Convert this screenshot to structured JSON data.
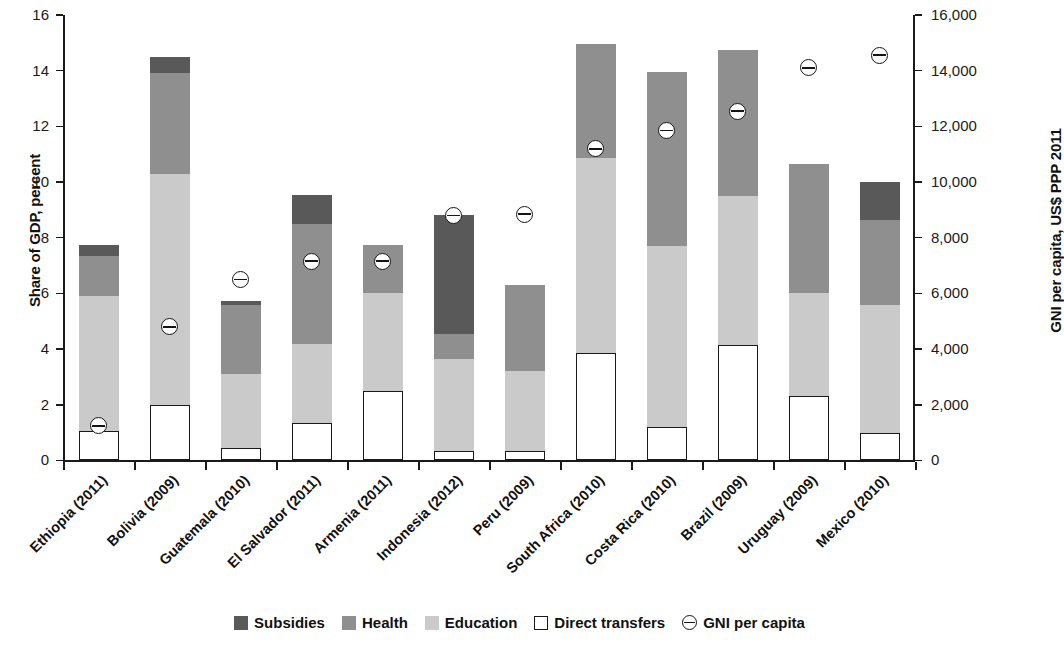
{
  "chart_data": {
    "type": "bar",
    "stacked": true,
    "title": "",
    "xlabel": "",
    "ylabel": "Share of GDP, percent",
    "y2label": "GNI per capita, US$ PPP 2011",
    "ylim": [
      0,
      16
    ],
    "y2lim": [
      0,
      16000
    ],
    "yticks": [
      "0",
      "2",
      "4",
      "6",
      "8",
      "10",
      "12",
      "14",
      "16"
    ],
    "ytick_values": [
      0,
      2,
      4,
      6,
      8,
      10,
      12,
      14,
      16
    ],
    "y2ticks": [
      "0",
      "2,000",
      "4,000",
      "6,000",
      "8,000",
      "10,000",
      "12,000",
      "14,000",
      "16,000"
    ],
    "y2tick_values": [
      0,
      2000,
      4000,
      6000,
      8000,
      10000,
      12000,
      14000,
      16000
    ],
    "grid": false,
    "legend_position": "bottom",
    "categories": [
      "Ethiopia (2011)",
      "Bolivia (2009)",
      "Guatemala (2010)",
      "El Salvador (2011)",
      "Armenia (2011)",
      "Indonesia (2012)",
      "Peru (2009)",
      "South Africa (2010)",
      "Costa Rica (2010)",
      "Brazil (2009)",
      "Uruguay (2009)",
      "Mexico (2010)"
    ],
    "series": [
      {
        "name": "Direct transfers",
        "color": "#ffffff",
        "values": [
          1.05,
          2.0,
          0.45,
          1.35,
          2.5,
          0.35,
          0.35,
          3.85,
          1.2,
          4.15,
          2.3,
          1.0
        ]
      },
      {
        "name": "Education",
        "color": "#cacaca",
        "values": [
          4.85,
          8.3,
          2.65,
          2.85,
          3.5,
          3.3,
          2.85,
          7.0,
          6.5,
          5.35,
          3.7,
          4.6
        ]
      },
      {
        "name": "Health",
        "color": "#8f8f8f",
        "values": [
          1.45,
          3.6,
          2.5,
          4.3,
          1.75,
          0.9,
          3.1,
          4.1,
          6.25,
          5.25,
          4.65,
          3.05
        ]
      },
      {
        "name": "Subsidies",
        "color": "#595959",
        "values": [
          0.4,
          0.6,
          0.12,
          1.05,
          0.0,
          4.25,
          0.0,
          0.0,
          0.0,
          0.0,
          0.0,
          1.35
        ]
      }
    ],
    "totals": [
      7.75,
      14.5,
      5.72,
      9.55,
      7.75,
      8.8,
      6.3,
      14.95,
      13.95,
      14.75,
      10.65,
      10.0
    ],
    "gni_series": {
      "name": "GNI per capita",
      "marker": "circle-with-horizontal-line",
      "values": [
        1250,
        4800,
        6500,
        7150,
        7150,
        8800,
        8850,
        11200,
        11850,
        12550,
        14100,
        14550
      ]
    }
  },
  "legend": {
    "items": [
      {
        "label": "Subsidies",
        "swatch": "subsidies"
      },
      {
        "label": "Health",
        "swatch": "health"
      },
      {
        "label": "Education",
        "swatch": "education"
      },
      {
        "label": "Direct transfers",
        "swatch": "transfers"
      },
      {
        "label": "GNI per capita",
        "swatch": "gni"
      }
    ]
  }
}
